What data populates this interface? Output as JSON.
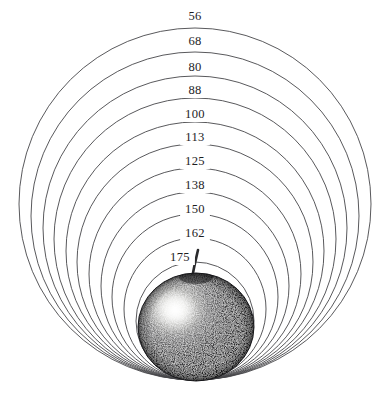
{
  "figure": {
    "name": "nested-circles-apple-diagram",
    "background_color": "#ffffff",
    "width": 384,
    "height": 398,
    "style": "stipple-engraving",
    "tangent_point": {
      "x": 195,
      "y": 380
    }
  },
  "chart_data": {
    "type": "scatter",
    "title": "",
    "subtitle": "",
    "xlabel": "",
    "ylabel": "",
    "grid": false,
    "legend": "none",
    "annotations": [],
    "categories": [
      "56",
      "68",
      "80",
      "88",
      "100",
      "113",
      "125",
      "138",
      "150",
      "162",
      "175"
    ],
    "values": [
      56,
      68,
      80,
      88,
      100,
      113,
      125,
      138,
      150,
      162,
      175
    ],
    "labels": [
      {
        "text": "56",
        "x": 195,
        "y": 20,
        "radius": 176,
        "cy": 204
      },
      {
        "text": "68",
        "x": 195,
        "y": 45,
        "radius": 164,
        "cy": 216
      },
      {
        "text": "80",
        "x": 195,
        "y": 71,
        "radius": 152,
        "cy": 228
      },
      {
        "text": "88",
        "x": 195,
        "y": 94,
        "radius": 141,
        "cy": 239
      },
      {
        "text": "100",
        "x": 195,
        "y": 118,
        "radius": 129,
        "cy": 251
      },
      {
        "text": "113",
        "x": 195,
        "y": 141,
        "radius": 118,
        "cy": 262
      },
      {
        "text": "125",
        "x": 195,
        "y": 165,
        "radius": 106,
        "cy": 274
      },
      {
        "text": "138",
        "x": 195,
        "y": 189,
        "radius": 94,
        "cy": 286
      },
      {
        "text": "150",
        "x": 195,
        "y": 213,
        "radius": 83,
        "cy": 297
      },
      {
        "text": "162",
        "x": 195,
        "y": 237,
        "radius": 71,
        "cy": 309
      },
      {
        "text": "175",
        "x": 180,
        "y": 261,
        "radius": 59,
        "cy": 321
      }
    ],
    "ring_stroke_color": "#46464a",
    "label_text_color": "#1d1d1f"
  },
  "apple": {
    "name": "apple-illustration",
    "center_x": 196,
    "center_y": 327,
    "radius_x": 58,
    "radius_y": 54,
    "top": 272,
    "bottom": 380,
    "left": 138,
    "right": 253,
    "body_color": "#3a3a3c",
    "highlight_color": "#f2f2f0",
    "highlight_x": 175,
    "highlight_y": 311,
    "stem_color": "#2a2a2c",
    "stem_top_x": 198,
    "stem_top_y": 250,
    "stem_base_x": 192,
    "stem_base_y": 279
  }
}
